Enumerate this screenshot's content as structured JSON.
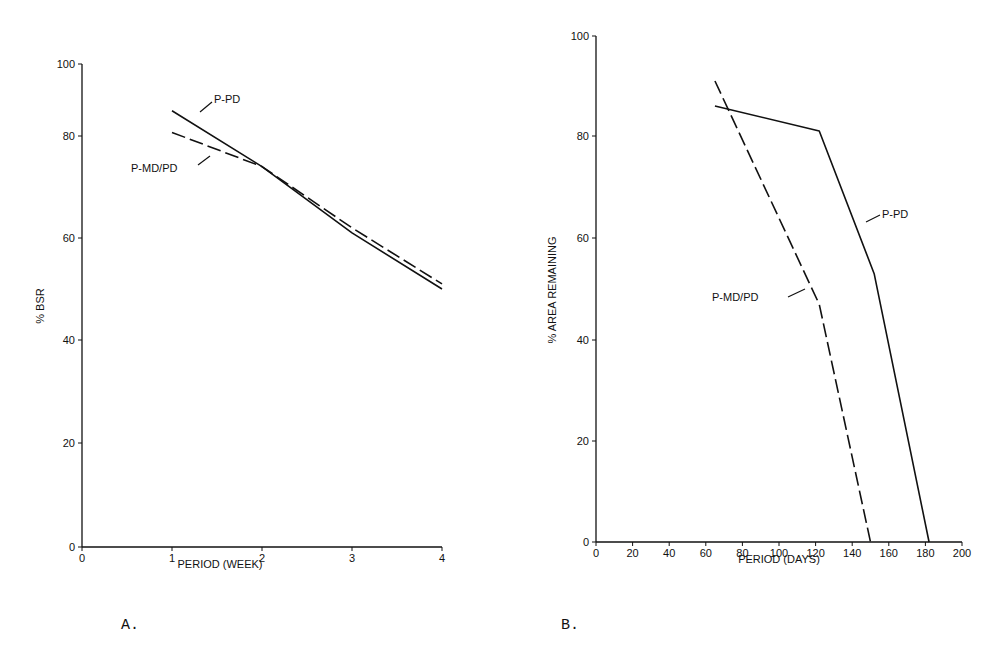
{
  "chart_data": [
    {
      "id": "A",
      "type": "line",
      "title": "",
      "panel_label": "A.",
      "xlabel": "PERIOD (WEEK)",
      "ylabel": "% BSR",
      "xlim": [
        0,
        4
      ],
      "ylim": [
        0,
        100
      ],
      "xticks": [
        "0",
        "1",
        "2",
        "3",
        "4"
      ],
      "yticks": [
        "0",
        "20",
        "40",
        "60",
        "80",
        "100"
      ],
      "grid": false,
      "legend": "inline annotations",
      "series": [
        {
          "name": "P-PD",
          "style": "solid",
          "x": [
            1,
            2,
            3,
            4
          ],
          "values": [
            87,
            74,
            61,
            50
          ]
        },
        {
          "name": "P-MD/PD",
          "style": "dashed",
          "x": [
            1,
            2,
            3,
            4
          ],
          "values": [
            81,
            74,
            62,
            51
          ]
        }
      ]
    },
    {
      "id": "B",
      "type": "line",
      "title": "",
      "panel_label": "B.",
      "xlabel": "PERIOD (DAYS)",
      "ylabel": "% AREA REMAINING",
      "xlim": [
        0,
        200
      ],
      "ylim": [
        0,
        100
      ],
      "xticks": [
        "0",
        "20",
        "40",
        "60",
        "80",
        "100",
        "120",
        "140",
        "160",
        "180",
        "200"
      ],
      "yticks": [
        "0",
        "20",
        "40",
        "60",
        "80",
        "100"
      ],
      "grid": false,
      "legend": "inline annotations",
      "series": [
        {
          "name": "P-PD",
          "style": "solid",
          "x": [
            65,
            122,
            152,
            182
          ],
          "values": [
            86,
            81,
            53,
            0
          ]
        },
        {
          "name": "P-MD/PD",
          "style": "dashed",
          "x": [
            65,
            122,
            150
          ],
          "values": [
            91,
            47,
            0
          ]
        }
      ]
    }
  ],
  "labels": {
    "a_ppd": "P-PD",
    "a_pmdpd": "P-MD/PD",
    "b_ppd": "P-PD",
    "b_pmdpd": "P-MD/PD",
    "panel_a": "A.",
    "panel_b": "B.",
    "a_xlabel": "PERIOD (WEEK)",
    "a_ylabel": "% BSR",
    "b_xlabel": "PERIOD (DAYS)",
    "b_ylabel": "% AREA REMAINING"
  }
}
